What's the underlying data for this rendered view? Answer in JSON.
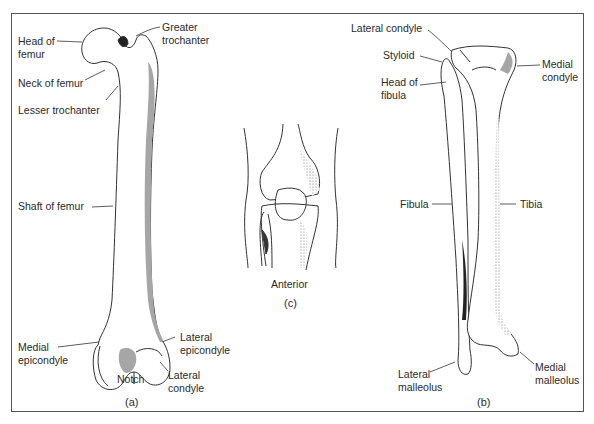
{
  "figure": {
    "panels": [
      {
        "id": "a",
        "caption": "(a)",
        "subject": "Femur",
        "labels": {
          "head_of_femur": [
            "Head of",
            "femur"
          ],
          "greater_trochanter": [
            "Greater",
            "trochanter"
          ],
          "neck_of_femur": "Neck of femur",
          "lesser_trochanter": "Lesser trochanter",
          "shaft_of_femur": "Shaft of femur",
          "medial_epicondyle": [
            "Medial",
            "epicondyle"
          ],
          "lateral_epicondyle": [
            "Lateral",
            "epicondyle"
          ],
          "notch": "Notch",
          "lateral_condyle": [
            "Lateral",
            "condyle"
          ]
        }
      },
      {
        "id": "c",
        "caption": "(c)",
        "subject": "Knee joint",
        "labels": {
          "view": "Anterior"
        }
      },
      {
        "id": "b",
        "caption": "(b)",
        "subject": "Tibia and fibula",
        "labels": {
          "lateral_condyle": "Lateral condyle",
          "styloid": "Styloid",
          "head_of_fibula": [
            "Head of",
            "fibula"
          ],
          "medial_condyle": [
            "Medial",
            "condyle"
          ],
          "fibula": "Fibula",
          "tibia": "Tibia",
          "lateral_malleolus": [
            "Lateral",
            "malleolus"
          ],
          "medial_malleolus": [
            "Medial",
            "malleolus"
          ]
        }
      }
    ]
  }
}
